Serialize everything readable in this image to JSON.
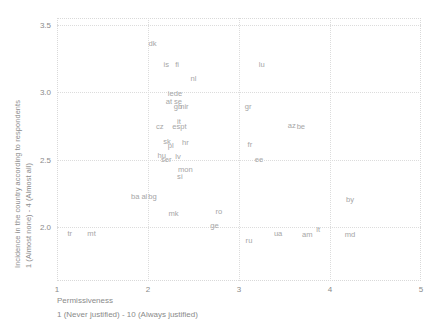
{
  "chart_data": {
    "type": "scatter",
    "title": "",
    "xlabel": "Permissiveness",
    "xlabel_sub": "1 (Never justified) - 10 (Always justified)",
    "ylabel_line1": "Incidence in the country according to respondents",
    "ylabel_line2": "1 (Almost none) - 4 (Almost all)",
    "xlim": [
      1,
      5
    ],
    "ylim": [
      1.6,
      3.55
    ],
    "xticks": [
      "1",
      "2",
      "3",
      "4",
      "5"
    ],
    "xtick_values": [
      1,
      2,
      3,
      4,
      5
    ],
    "yticks": [
      "3.5",
      "3.0",
      "2.5",
      "2.0"
    ],
    "ytick_values": [
      3.5,
      3.0,
      2.5,
      2.0
    ],
    "grid": true,
    "legend": "none",
    "marker_style": "text-label",
    "label_color": "#a6a6a6",
    "grid_color": "#dcdcdc",
    "axis_text_color": "#8a8a8a",
    "points": [
      {
        "label": "dk",
        "x": 2.05,
        "y": 3.36
      },
      {
        "label": "is",
        "x": 2.2,
        "y": 3.2
      },
      {
        "label": "fi",
        "x": 2.32,
        "y": 3.2
      },
      {
        "label": "nl",
        "x": 2.5,
        "y": 3.1
      },
      {
        "label": "lu",
        "x": 3.25,
        "y": 3.2
      },
      {
        "label": "ie",
        "x": 2.25,
        "y": 2.99
      },
      {
        "label": "de",
        "x": 2.33,
        "y": 2.99
      },
      {
        "label": "at",
        "x": 2.23,
        "y": 2.93
      },
      {
        "label": "se",
        "x": 2.33,
        "y": 2.93
      },
      {
        "label": "gb",
        "x": 2.33,
        "y": 2.89
      },
      {
        "label": "nir",
        "x": 2.4,
        "y": 2.89
      },
      {
        "label": "gr",
        "x": 3.1,
        "y": 2.89
      },
      {
        "label": "it",
        "x": 2.34,
        "y": 2.78
      },
      {
        "label": "cz",
        "x": 2.13,
        "y": 2.74
      },
      {
        "label": "es",
        "x": 2.31,
        "y": 2.74
      },
      {
        "label": "pt",
        "x": 2.39,
        "y": 2.74
      },
      {
        "label": "az",
        "x": 3.58,
        "y": 2.75
      },
      {
        "label": "be",
        "x": 3.68,
        "y": 2.74
      },
      {
        "label": "sk",
        "x": 2.21,
        "y": 2.63
      },
      {
        "label": "pl",
        "x": 2.25,
        "y": 2.6
      },
      {
        "label": "hr",
        "x": 2.41,
        "y": 2.62
      },
      {
        "label": "fr",
        "x": 3.12,
        "y": 2.61
      },
      {
        "label": "hu",
        "x": 2.15,
        "y": 2.53
      },
      {
        "label": "ser",
        "x": 2.2,
        "y": 2.5
      },
      {
        "label": "lv",
        "x": 2.33,
        "y": 2.52
      },
      {
        "label": "ee",
        "x": 3.22,
        "y": 2.5
      },
      {
        "label": "mon",
        "x": 2.41,
        "y": 2.42
      },
      {
        "label": "si",
        "x": 2.35,
        "y": 2.37
      },
      {
        "label": "ba",
        "x": 1.86,
        "y": 2.22
      },
      {
        "label": "al",
        "x": 1.96,
        "y": 2.22
      },
      {
        "label": "bg",
        "x": 2.05,
        "y": 2.22
      },
      {
        "label": "by",
        "x": 4.22,
        "y": 2.2
      },
      {
        "label": "mk",
        "x": 2.28,
        "y": 2.1
      },
      {
        "label": "ro",
        "x": 2.78,
        "y": 2.11
      },
      {
        "label": "ge",
        "x": 2.73,
        "y": 2.01
      },
      {
        "label": "tr",
        "x": 1.14,
        "y": 1.95
      },
      {
        "label": "mt",
        "x": 1.38,
        "y": 1.95
      },
      {
        "label": "ua",
        "x": 3.43,
        "y": 1.95
      },
      {
        "label": "am",
        "x": 3.75,
        "y": 1.94
      },
      {
        "label": "lt",
        "x": 3.87,
        "y": 1.98
      },
      {
        "label": "md",
        "x": 4.22,
        "y": 1.94
      },
      {
        "label": "ru",
        "x": 3.11,
        "y": 1.9
      }
    ]
  }
}
